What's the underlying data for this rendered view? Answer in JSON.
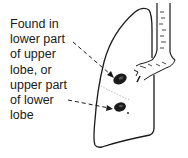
{
  "figure": {
    "annotation": {
      "lines": [
        "Found in",
        "lower part",
        "of upper",
        "lobe, or",
        "upper part",
        "of lower",
        "lobe"
      ]
    },
    "markers": [
      {
        "name": "lesion-upper-lobe",
        "description": "dark oval lesion in lower part of upper lobe"
      },
      {
        "name": "lesion-lower-lobe",
        "description": "dark oval lesion in upper part of lower lobe"
      }
    ],
    "colors": {
      "ink": "#1a1a1a",
      "fissure": "#b8b8b8",
      "background": "#ffffff"
    }
  }
}
